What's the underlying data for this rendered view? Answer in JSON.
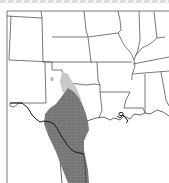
{
  "map": {
    "type": "species-range-map",
    "region": "South-central United States and northeastern Mexico",
    "states_visible": [
      "Colorado",
      "Kansas",
      "Missouri",
      "Illinois",
      "Indiana",
      "Kentucky",
      "Tennessee",
      "Arkansas",
      "Oklahoma",
      "New Mexico",
      "Texas",
      "Louisiana",
      "Mississippi",
      "Alabama"
    ],
    "layers": [
      {
        "name": "primary-range",
        "fill": "#7a7a7a",
        "description": "dark stippled range: south Texas into northeastern Mexico"
      },
      {
        "name": "peripheral-range",
        "fill": "#c8c8c8",
        "description": "light gray range: north-central Texas"
      },
      {
        "name": "isolated-record",
        "fill": "#bdbdbd",
        "description": "small isolated spot in west Texas"
      }
    ],
    "colors": {
      "background": "#ffffff",
      "border": "#555555",
      "range_dark": "#7a7a7a",
      "range_light": "#c8c8c8",
      "river": "#1a1a1a"
    }
  }
}
